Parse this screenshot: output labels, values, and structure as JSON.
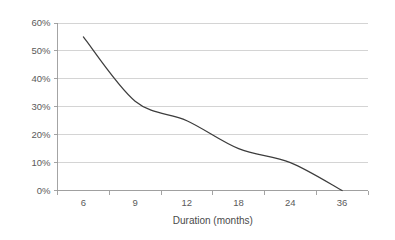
{
  "chart_data": {
    "type": "line",
    "title": "",
    "subtitle": "",
    "xlabel": "Duration (months)",
    "ylabel": "",
    "categories": [
      "6",
      "9",
      "12",
      "18",
      "24",
      "36"
    ],
    "x": [
      6,
      9,
      12,
      18,
      24,
      36
    ],
    "values": [
      0.55,
      0.32,
      0.25,
      0.15,
      0.1,
      0.0
    ],
    "values_percent": [
      "55%",
      "32%",
      "25%",
      "15%",
      "10%",
      "0%"
    ],
    "series": [
      {
        "name": "",
        "values": [
          0.55,
          0.32,
          0.25,
          0.15,
          0.1,
          0.0
        ]
      }
    ],
    "ylim": [
      0,
      0.6
    ],
    "y_ticks": [
      0,
      0.1,
      0.2,
      0.3,
      0.4,
      0.5,
      0.6
    ],
    "y_tick_labels": [
      "0%",
      "10%",
      "20%",
      "30%",
      "40%",
      "50%",
      "60%"
    ],
    "x_tick_labels": [
      "6",
      "9",
      "12",
      "18",
      "24",
      "36"
    ],
    "grid": true,
    "grid_axis": "y",
    "legend": false,
    "legend_position": "none",
    "markers": false,
    "smoothed": true,
    "annotations": [],
    "colors": {
      "line": "#3d3d3d",
      "gridline": "#c9c9c9",
      "axis": "#9a9a9a",
      "text": "#5a5a5a",
      "background": "#ffffff"
    }
  }
}
